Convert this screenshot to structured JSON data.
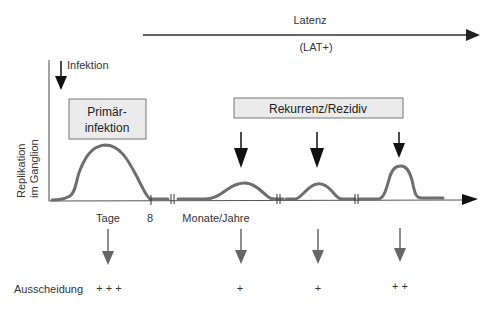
{
  "latency": {
    "label": "Latenz",
    "sublabel": "(LAT+)"
  },
  "infection": {
    "label": "Infektion"
  },
  "y_axis": {
    "label_line1": "Replikation",
    "label_line2": "im Ganglion"
  },
  "boxes": {
    "primary_line1": "Primär-",
    "primary_line2": "infektion",
    "recurrence": "Rekurrenz/Rezidiv"
  },
  "x_axis": {
    "tick_days": "Tage",
    "tick_8": "8",
    "tick_months": "Monate/Jahre"
  },
  "shedding": {
    "label": "Ausscheidung",
    "levels": [
      "+ + +",
      "+",
      "+",
      "+ +"
    ]
  },
  "colors": {
    "curve": "#6e6e6e",
    "box_fill": "#ebebeb",
    "box_border": "#777777",
    "arrow_dark": "#111111",
    "arrow_gray": "#666666",
    "axis": "#333333"
  }
}
